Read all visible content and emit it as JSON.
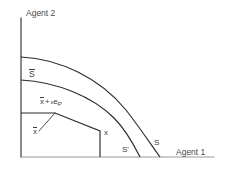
{
  "figure": {
    "type": "economics-diagram",
    "title_present": false,
    "background_color": "#ffffff",
    "line_color": "#2b2b2b",
    "text_color": "#3c3c3c",
    "axes": {
      "y_axis_label": "Agent 2",
      "x_axis_label": "Agent 1",
      "origin_px": [
        21,
        157
      ],
      "y_axis_top_px": 18,
      "x_axis_right_px": 214
    },
    "labels": {
      "s_bar": "S",
      "s_bar_has_overbar": true,
      "x_bar_plus_eps": {
        "x_bar": "x",
        "plus": "+",
        "epsilon": "ε",
        "e": "e",
        "subscript": "P"
      },
      "x_bar": "x",
      "x_bar_has_overbar": true,
      "x_point": "x",
      "s_prime": "S'",
      "s": "S"
    },
    "curves": [
      {
        "name": "S-bar-frontier",
        "description": "outer concave frontier from y-axis down to x-axis",
        "y_intercept_px": 57,
        "x_intercept_px": 160
      },
      {
        "name": "S-frontier",
        "description": "inner concave frontier from y-axis down to x-axis",
        "y_intercept_px": 80,
        "x_intercept_px": 140
      },
      {
        "name": "S-prime-step-boundary",
        "description": "piecewise rectangular/step boundary of the smaller feasible set",
        "y_intercept_px": 113,
        "x_intercept_px": 100
      }
    ],
    "crossing_point_px": [
      128,
      132
    ],
    "leader_line": {
      "from_px": [
        39,
        131
      ],
      "to_px": [
        55,
        113
      ]
    }
  }
}
